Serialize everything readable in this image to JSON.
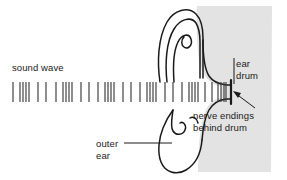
{
  "figure": {
    "background_color": "#ffffff",
    "ink_color": "#1a1a1a",
    "head_fill_color": "#e2e2e2",
    "wave_line_color": "#3a3a3a"
  },
  "labels": {
    "sound_wave": "sound wave",
    "ear_drum_line1": "ear",
    "ear_drum_line2": "drum",
    "nerve_line1": "nerve endings",
    "nerve_line2": "behind drum",
    "outer_ear_line1": "outer",
    "outer_ear_line2": "ear"
  },
  "chart_data": {
    "type": "line",
    "title": "sound wave",
    "xlabel": "",
    "ylabel": "",
    "x_range_px": [
      13,
      226
    ],
    "y_range_px": [
      82,
      102
    ],
    "tick_positions_px": [
      13,
      20,
      23,
      26,
      29,
      38,
      46,
      56,
      63,
      66,
      69,
      72,
      81,
      89,
      98,
      105,
      108,
      111,
      114,
      123,
      131,
      140,
      147,
      150,
      153,
      156,
      165,
      173,
      182,
      189,
      192,
      195,
      198,
      205,
      212,
      218,
      221,
      224,
      226
    ],
    "compression_groups": 5,
    "legend_position": "none",
    "grid": false
  },
  "annotations": {
    "ear_drum_leader": "arrow from 'ear drum' label pointing left to the tympanic membrane",
    "nerve_leader": "diagonal arrow from 'nerve endings behind drum' label pointing up-left to behind the drum",
    "outer_ear_leader": "horizontal line from 'outer' label pointing right to the lobe of the pinna"
  }
}
